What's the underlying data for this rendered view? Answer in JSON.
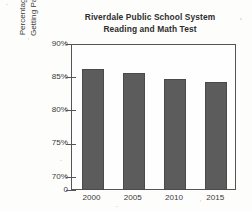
{
  "chart_data": {
    "type": "bar",
    "title": "Riverdale Public School System Reading and Math Test",
    "title_lines": [
      "Riverdale Public School System",
      "Reading and Math Test"
    ],
    "xlabel": "",
    "ylabel": "Percentage of Students Getting Passing Grades",
    "ylabel_lines": [
      "Percentage of Students",
      "Getting Passing Grades"
    ],
    "categories": [
      "2000",
      "2005",
      "2010",
      "2015"
    ],
    "values": [
      86.2,
      85.6,
      84.8,
      84.3
    ],
    "value_labels": [
      "86%",
      "85.5%",
      "85%",
      "84%"
    ],
    "ylim": [
      68,
      90
    ],
    "y_ticks": [
      {
        "label": "90%",
        "value": 90
      },
      {
        "label": "85%",
        "value": 85
      },
      {
        "label": "80%",
        "value": 80
      },
      {
        "label": "75%",
        "value": 75
      },
      {
        "label": "70%",
        "value": 70
      },
      {
        "label": "0",
        "value": 68
      }
    ],
    "axis_break": true,
    "grid": false,
    "legend": null,
    "bar_color": "#5c5c5c",
    "axis_color": "#555555",
    "text_color": "#3a3a3a"
  }
}
